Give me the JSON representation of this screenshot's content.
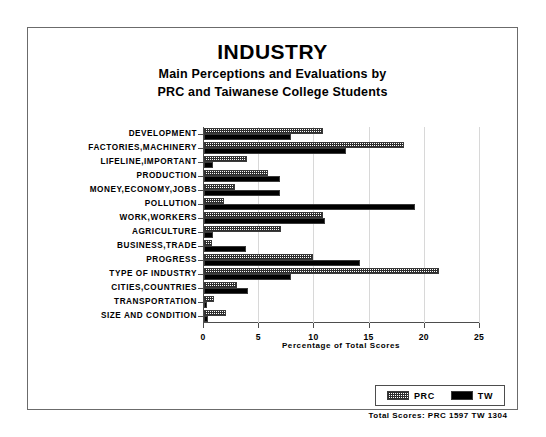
{
  "chart_data": {
    "type": "bar",
    "orientation": "horizontal",
    "title": "INDUSTRY",
    "subtitle_line1": "Main Perceptions and Evaluations by",
    "subtitle_line2": "PRC and Taiwanese College Students",
    "xlabel": "Percentage of Total Scores",
    "ylabel": "",
    "xlim": [
      0,
      25
    ],
    "xticks": [
      0,
      5,
      10,
      15,
      20,
      25
    ],
    "xtick_labels": [
      "0",
      "5",
      "10",
      "15",
      "20",
      "25"
    ],
    "grid": true,
    "legend_position": "bottom-right",
    "categories": [
      "DEVELOPMENT",
      "FACTORIES,MACHINERY",
      "LIFELINE,IMPORTANT",
      "PRODUCTION",
      "MONEY,ECONOMY,JOBS",
      "POLLUTION",
      "WORK,WORKERS",
      "AGRICULTURE",
      "BUSINESS,TRADE",
      "PROGRESS",
      "TYPE OF INDUSTRY",
      "CITIES,COUNTRIES",
      "TRANSPORTATION",
      "SIZE AND CONDITION"
    ],
    "series": [
      {
        "name": "PRC",
        "style": "hatched",
        "values": [
          10.8,
          18.1,
          3.9,
          5.8,
          2.8,
          1.8,
          10.8,
          7.0,
          0.7,
          9.9,
          21.3,
          3.0,
          0.9,
          2.0
        ]
      },
      {
        "name": "TW",
        "style": "solid-black",
        "values": [
          7.9,
          12.9,
          0.8,
          6.9,
          6.9,
          19.1,
          11.0,
          0.8,
          3.8,
          14.1,
          7.9,
          4.0,
          0.3,
          0.4
        ]
      }
    ],
    "annotations": {
      "total_scores": "Total Scores:  PRC 1597   TW 1304"
    }
  },
  "legend": {
    "items": [
      {
        "label": "PRC"
      },
      {
        "label": "TW"
      }
    ]
  }
}
